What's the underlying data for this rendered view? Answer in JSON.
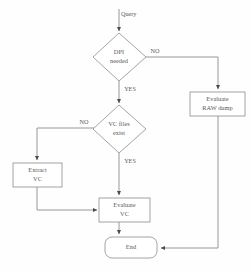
{
  "diagram": {
    "colors": {
      "background": "#fefefe",
      "shape_fill": "#ffffff",
      "shape_stroke": "#8d8d8d",
      "line": "#8d8d8d",
      "arrow": "#4a4a4a",
      "text": "#5a5a5a"
    },
    "nodes": {
      "start_label": "Query",
      "decision_dpi": {
        "line1": "DPI",
        "line2": "needed"
      },
      "decision_vc": {
        "line1": "VC files",
        "line2": "exist"
      },
      "process_raw": {
        "line1": "Evaluate",
        "line2": "RAW dump"
      },
      "process_extract": {
        "line1": "Extract",
        "line2": "VC"
      },
      "process_evaluate": {
        "line1": "Evaluate",
        "line2": "VC"
      },
      "terminator_end": {
        "label": "End"
      }
    },
    "edges": {
      "dpi_no": "NO",
      "dpi_yes": "YES",
      "vc_no": "NO",
      "vc_yes": "YES"
    }
  }
}
